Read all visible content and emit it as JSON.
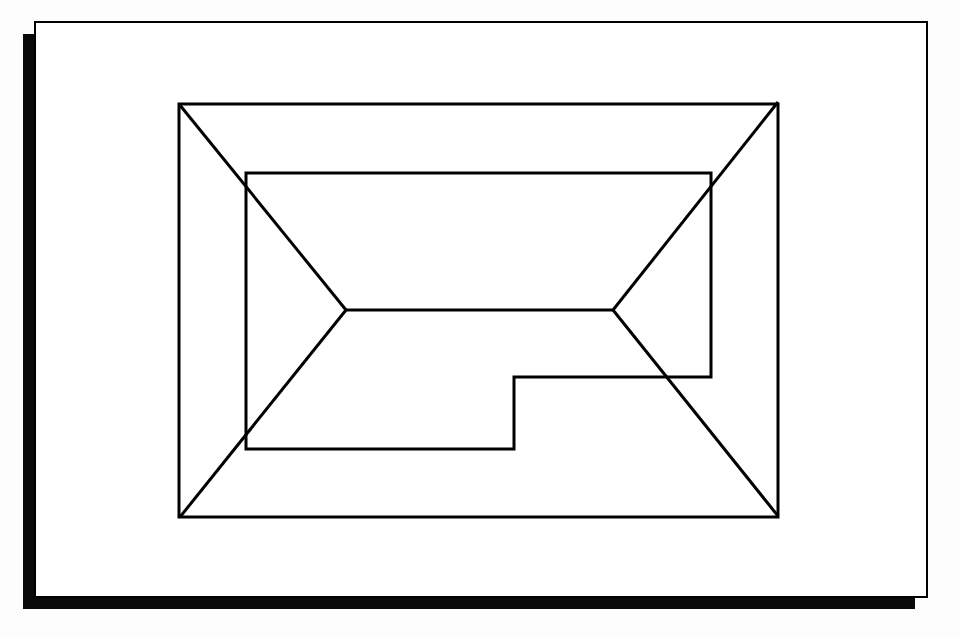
{
  "diagram": {
    "type": "roof-plan",
    "colors": {
      "background": "#fdfdfd",
      "panel": "#ffffff",
      "shadow": "#0a0a0a",
      "stroke": "#000000"
    },
    "frame": {
      "x": 35,
      "y": 22,
      "width": 892,
      "height": 575,
      "shadow_offset_x": -12,
      "shadow_offset_y": 12
    },
    "outer_rectangle": {
      "x1": 179,
      "y1": 104,
      "x2": 778,
      "y2": 517
    },
    "ridge": {
      "x1": 346,
      "y1": 310,
      "x2": 613,
      "y2": 310
    },
    "hips": [
      {
        "from": [
          179,
          104
        ],
        "to": [
          346,
          310
        ]
      },
      {
        "from": [
          180,
          517
        ],
        "to": [
          346,
          310
        ]
      },
      {
        "from": [
          778,
          102
        ],
        "to": [
          613,
          310
        ]
      },
      {
        "from": [
          778,
          516
        ],
        "to": [
          613,
          310
        ]
      }
    ],
    "inner_outline": [
      [
        246,
        173
      ],
      [
        711,
        173
      ],
      [
        711,
        377
      ],
      [
        514,
        377
      ],
      [
        514,
        449
      ],
      [
        246,
        449
      ]
    ]
  }
}
